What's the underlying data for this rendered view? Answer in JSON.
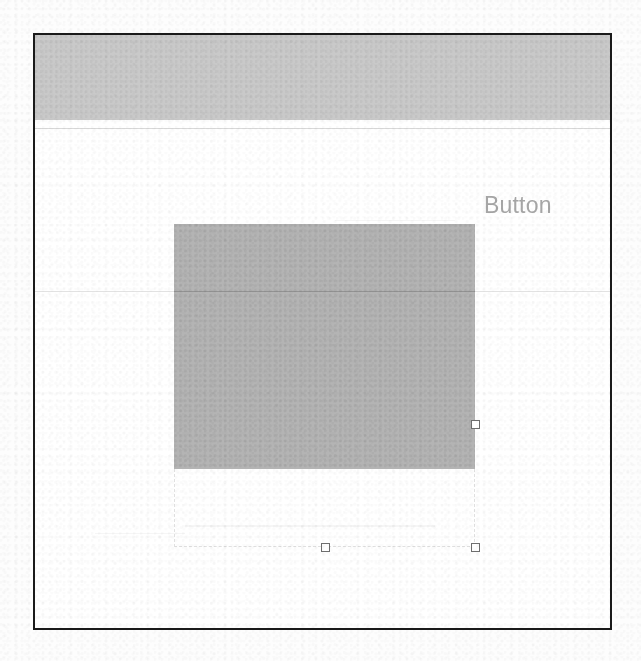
{
  "document": {
    "kind": "scanned-ui-mockup",
    "width": 641,
    "height": 661,
    "background_color": "#fdfdfd"
  },
  "window": {
    "name": "design-canvas-window",
    "border_color": "#1a1a1a",
    "background_color": "#ffffff"
  },
  "header": {
    "name": "header-banner",
    "fill_color": "#c9c9c9",
    "rule_color": "#d9d9d9"
  },
  "canvas": {
    "guide_line_color": "#e2e2e2",
    "label": {
      "text": "Button",
      "color": "#a6a6a6",
      "font_size_px": 23
    }
  },
  "selection": {
    "name": "selected-shape",
    "shape_fill_color": "#b4b4b4",
    "bounding_box_stroke": "#e0e0e0",
    "handles": [
      {
        "id": "middle-right",
        "position": "middle-right"
      },
      {
        "id": "bottom-center",
        "position": "bottom-center"
      },
      {
        "id": "bottom-right",
        "position": "bottom-right"
      }
    ],
    "handle_fill": "#ffffff",
    "handle_stroke": "#6e6e6e"
  }
}
